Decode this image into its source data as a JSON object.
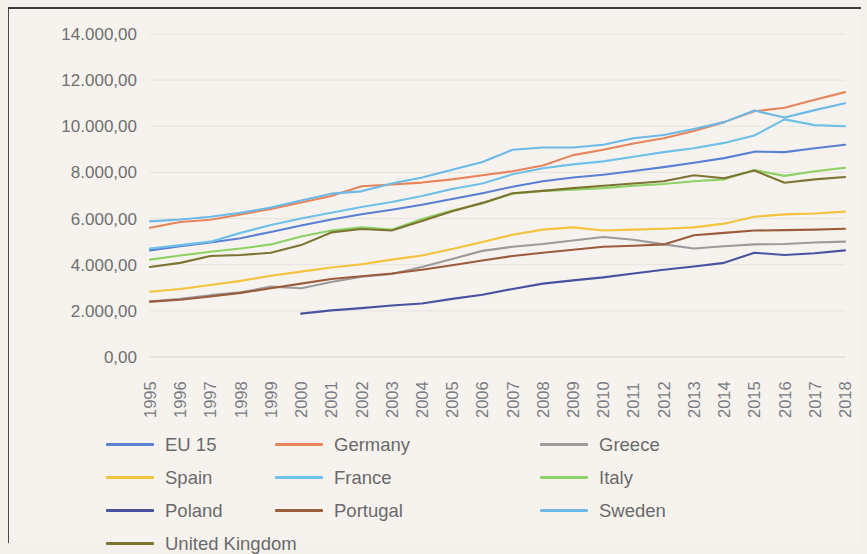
{
  "chart_data": {
    "type": "line",
    "title": "",
    "xlabel": "",
    "ylabel": "",
    "ylim": [
      0,
      14000
    ],
    "ytick_labels": [
      "14.000,00",
      "12.000,00",
      "10.000,00",
      "8.000,00",
      "6.000,00",
      "4.000,00",
      "2.000,00",
      "0,00"
    ],
    "ytick_values": [
      14000,
      12000,
      10000,
      8000,
      6000,
      4000,
      2000,
      0
    ],
    "grid": true,
    "legend_position": "bottom",
    "number_format": "european",
    "categories": [
      "1995",
      "1996",
      "1997",
      "1998",
      "1999",
      "2000",
      "2001",
      "2002",
      "2003",
      "2004",
      "2005",
      "2006",
      "2007",
      "2008",
      "2009",
      "2010",
      "2011",
      "2012",
      "2013",
      "2014",
      "2015",
      "2016",
      "2017",
      "2018"
    ],
    "series": [
      {
        "name": "EU 15",
        "color": "#5b7fd4",
        "values": [
          4620,
          4800,
          4960,
          5150,
          5420,
          5700,
          5960,
          6190,
          6380,
          6600,
          6850,
          7100,
          7380,
          7620,
          7780,
          7900,
          8060,
          8230,
          8420,
          8620,
          8900,
          8880,
          9050,
          9200
        ]
      },
      {
        "name": "Germany",
        "color": "#e8845c",
        "values": [
          5600,
          5850,
          5950,
          6180,
          6420,
          6700,
          6980,
          7400,
          7480,
          7560,
          7700,
          7880,
          8050,
          8300,
          8750,
          8980,
          9250,
          9480,
          9800,
          10180,
          10650,
          10800,
          11150,
          11480
        ]
      },
      {
        "name": "Greece",
        "color": "#9b9b9b",
        "values": [
          2400,
          2520,
          2680,
          2800,
          3050,
          2980,
          3250,
          3480,
          3600,
          3900,
          4250,
          4600,
          4780,
          4900,
          5050,
          5200,
          5080,
          4880,
          4700,
          4800,
          4880,
          4900,
          4960,
          5000
        ]
      },
      {
        "name": "Spain",
        "color": "#f3c33c",
        "values": [
          2830,
          2950,
          3120,
          3300,
          3520,
          3700,
          3880,
          4020,
          4220,
          4400,
          4680,
          4980,
          5300,
          5520,
          5620,
          5480,
          5520,
          5560,
          5620,
          5780,
          6080,
          6180,
          6220,
          6300
        ]
      },
      {
        "name": "France",
        "color": "#6fc0e8"
      },
      {
        "name": "Italy",
        "color": "#8ed164"
      },
      {
        "name": "Poland",
        "color": "#4a52a0"
      },
      {
        "name": "Portugal",
        "color": "#9b5c3e"
      },
      {
        "name": "Sweden",
        "color": "#6cb9e8"
      },
      {
        "name": "United Kingdom",
        "color": "#7d7434"
      }
    ],
    "series_values_extra": {
      "France": [
        4700,
        4850,
        5000,
        5380,
        5720,
        6000,
        6250,
        6500,
        6720,
        6980,
        7280,
        7520,
        7920,
        8180,
        8350,
        8480,
        8680,
        8880,
        9050,
        9280,
        9600,
        10300,
        10050,
        10000
      ],
      "Italy": [
        4220,
        4400,
        4560,
        4700,
        4880,
        5220,
        5480,
        5620,
        5520,
        5980,
        6350,
        6650,
        7080,
        7200,
        7250,
        7320,
        7420,
        7500,
        7620,
        7700,
        8100,
        7850,
        8050,
        8200
      ],
      "Poland": [
        null,
        null,
        null,
        null,
        null,
        1880,
        2020,
        2120,
        2230,
        2320,
        2520,
        2700,
        2950,
        3180,
        3320,
        3450,
        3620,
        3780,
        3920,
        4080,
        4520,
        4420,
        4500,
        4620
      ],
      "Portugal": [
        2400,
        2480,
        2620,
        2780,
        2980,
        3180,
        3380,
        3500,
        3620,
        3780,
        3980,
        4180,
        4380,
        4520,
        4650,
        4780,
        4820,
        4880,
        5280,
        5380,
        5480,
        5500,
        5520,
        5560
      ],
      "Sweden": [
        5880,
        5960,
        6080,
        6250,
        6480,
        6780,
        7080,
        7180,
        7520,
        7780,
        8120,
        8450,
        8980,
        9080,
        9080,
        9200,
        9480,
        9620,
        9880,
        10180,
        10680,
        10380,
        10700,
        11000
      ],
      "United Kingdom": [
        3900,
        4080,
        4380,
        4420,
        4520,
        4850,
        5400,
        5550,
        5480,
        5900,
        6320,
        6680,
        7100,
        7200,
        7320,
        7420,
        7520,
        7620,
        7880,
        7750,
        8080,
        7550,
        7700,
        7800
      ]
    }
  },
  "legend": {
    "rows": [
      [
        {
          "label": "EU 15",
          "color": "#5b7fd4"
        },
        {
          "label": "Germany",
          "color": "#e8845c"
        },
        {
          "label": "Greece",
          "color": "#9b9b9b"
        }
      ],
      [
        {
          "label": "Spain",
          "color": "#f3c33c"
        },
        {
          "label": "France",
          "color": "#6fc0e8"
        },
        {
          "label": "Italy",
          "color": "#8ed164"
        }
      ],
      [
        {
          "label": "Poland",
          "color": "#4a52a0"
        },
        {
          "label": "Portugal",
          "color": "#9b5c3e"
        },
        {
          "label": "Sweden",
          "color": "#6cb9e8"
        }
      ],
      [
        {
          "label": "United Kingdom",
          "color": "#7d7434"
        }
      ]
    ]
  }
}
